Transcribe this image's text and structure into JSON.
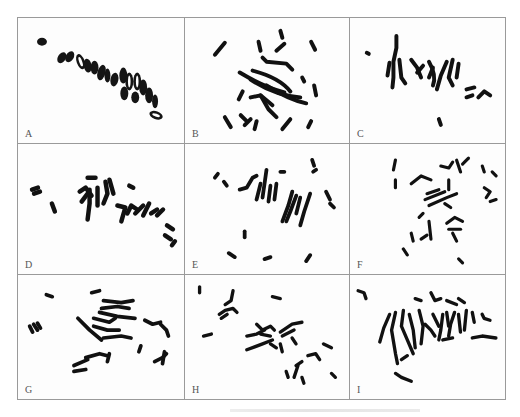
{
  "figure": {
    "panels": [
      {
        "label": "A",
        "row": 1,
        "col": 1
      },
      {
        "label": "B",
        "row": 1,
        "col": 2
      },
      {
        "label": "C",
        "row": 1,
        "col": 3
      },
      {
        "label": "D",
        "row": 2,
        "col": 1
      },
      {
        "label": "E",
        "row": 2,
        "col": 2
      },
      {
        "label": "F",
        "row": 2,
        "col": 3
      },
      {
        "label": "G",
        "row": 3,
        "col": 1
      },
      {
        "label": "H",
        "row": 3,
        "col": 2
      },
      {
        "label": "I",
        "row": 3,
        "col": 3
      }
    ],
    "colors": {
      "border": "#9a9a9a",
      "chromosome": "#111111",
      "label": "#555555"
    }
  }
}
